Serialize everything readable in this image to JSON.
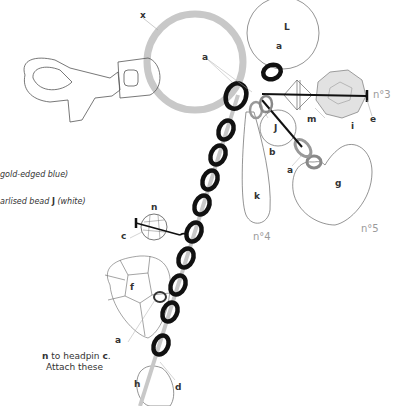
{
  "labels": {
    "x": "x",
    "L": "L",
    "a_top": "a",
    "a_ring": "a",
    "n3": "n°3",
    "e": "e",
    "i": "i",
    "m": "m",
    "J": "J",
    "b": "b",
    "a_heart": "a",
    "g": "g",
    "k": "k",
    "n4": "n°4",
    "n5": "n°5",
    "n": "n",
    "c": "c",
    "f": "f",
    "a_bottom": "a",
    "h": "h",
    "d": "d"
  },
  "text_fragments": {
    "line1": "gold-edged blue)",
    "line2_pre": "arlised bead ",
    "line2_bold": "J",
    "line2_post": " (white)",
    "line3_bold1": "n",
    "line3_mid": " to headpin ",
    "line3_bold2": "c",
    "line3_end": ".",
    "line4": "Attach these"
  },
  "colors": {
    "ring_grey": "#c8c8c8",
    "link_black": "#111111",
    "link_grey": "#bdbdbd",
    "outline": "#555555",
    "bead_fill": "#e2e2e2",
    "label_grey": "#9a9a9a"
  }
}
